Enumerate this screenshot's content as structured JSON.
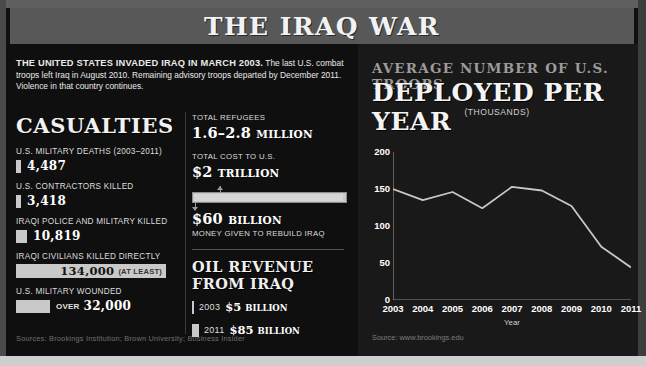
{
  "title": "THE IRAQ WAR",
  "intro": {
    "lead": "THE UNITED STATES INVADED IRAQ IN MARCH 2003.",
    "body": " The last U.S. combat troops left Iraq in August 2010. Remaining advisory troops departed by December 2011. Violence in that country continues."
  },
  "casualties": {
    "heading": "CASUALTIES",
    "items": [
      {
        "label": "U.S. MILITARY DEATHS (2003–2011)",
        "value": "4,487",
        "note": "",
        "bar_px": 5
      },
      {
        "label": "U.S. CONTRACTORS KILLED",
        "value": "3,418",
        "note": "",
        "bar_px": 5
      },
      {
        "label": "IRAQI POLICE AND MILITARY KILLED",
        "value": "10,819",
        "note": "",
        "bar_px": 11
      },
      {
        "label": "IRAQI CIVILIANS KILLED DIRECTLY",
        "value": "134,000",
        "note": "(AT LEAST)",
        "bar_px": 150
      },
      {
        "label": "U.S. MILITARY WOUNDED",
        "value": "32,000",
        "note": "OVER",
        "bar_px": 34
      }
    ]
  },
  "middle": {
    "refugees": {
      "label": "TOTAL REFUGEES",
      "value": "1.6–2.8",
      "unit": "MILLION"
    },
    "cost": {
      "label": "TOTAL COST TO U.S.",
      "value": "$2",
      "unit": "TRILLION"
    },
    "rebuild": {
      "value": "$60",
      "unit": "BILLION",
      "label": "MONEY GIVEN TO REBUILD IRAQ"
    },
    "oil": {
      "heading": "OIL REVENUE FROM IRAQ",
      "rows": [
        {
          "year": "2003",
          "value": "$5",
          "unit": "BILLION",
          "bar_px": 2
        },
        {
          "year": "2011",
          "value": "$85",
          "unit": "BILLION",
          "bar_px": 7
        }
      ]
    }
  },
  "sources_left": "Sources: Brookings Institution; Brown University; Business Insider",
  "chart_panel": {
    "header_top": "AVERAGE NUMBER OF U.S. TROOPS",
    "header_main": "DEPLOYED PER YEAR",
    "header_unit": "(THOUSANDS)",
    "source": "Source: www.brookings.edu"
  },
  "chart_data": {
    "type": "line",
    "xlabel": "Year",
    "ylabel": "(THOUSANDS)",
    "categories": [
      "2003",
      "2004",
      "2005",
      "2006",
      "2007",
      "2008",
      "2009",
      "2010",
      "2011"
    ],
    "values": [
      150,
      135,
      146,
      124,
      153,
      148,
      127,
      72,
      44
    ],
    "yticks": [
      0,
      50,
      100,
      150,
      200
    ],
    "ylim": [
      0,
      200
    ],
    "grid": false,
    "legend": false,
    "line_color": "#c8c8c8"
  }
}
